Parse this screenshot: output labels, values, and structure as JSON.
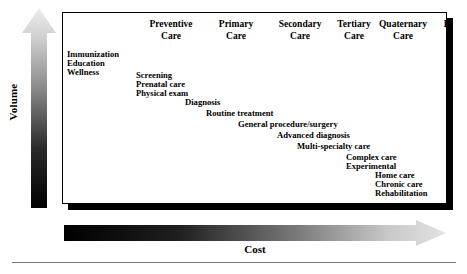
{
  "diagram": {
    "axes": {
      "vertical": {
        "label": "Volume",
        "icon": "up-arrow-icon",
        "direction": "up",
        "gradient_from": "#000000",
        "gradient_to": "#e8e8e8",
        "meaning": "volume increases downward toward preventive care"
      },
      "horizontal": {
        "label": "Cost",
        "icon": "right-arrow-icon",
        "direction": "right",
        "gradient_from": "#000000",
        "gradient_to": "#e0e0e0",
        "meaning": "cost increases toward extended care"
      }
    },
    "columns": [
      {
        "line1": "Preventive",
        "line2": "Care",
        "center_x": 108
      },
      {
        "line1": "Primary",
        "line2": "Care",
        "center_x": 173
      },
      {
        "line1": "Secondary",
        "line2": "Care",
        "center_x": 237
      },
      {
        "line1": "Tertiary",
        "line2": "Care",
        "center_x": 291
      },
      {
        "line1": "Quaternary",
        "line2": "Care",
        "center_x": 340
      },
      {
        "line1": "Extended",
        "line2": "Care",
        "center_x": 400
      }
    ],
    "services": [
      {
        "label": "Immunization",
        "x": 66,
        "y": 49,
        "column": "Preventive Care"
      },
      {
        "label": "Education",
        "x": 66,
        "y": 58,
        "column": "Preventive Care"
      },
      {
        "label": "Wellness",
        "x": 66,
        "y": 67,
        "column": "Preventive Care"
      },
      {
        "label": "Screening",
        "x": 135,
        "y": 70,
        "column": "Primary Care"
      },
      {
        "label": "Prenatal care",
        "x": 135,
        "y": 79,
        "column": "Primary Care"
      },
      {
        "label": "Physical exam",
        "x": 135,
        "y": 88,
        "column": "Primary Care"
      },
      {
        "label": "Diagnosis",
        "x": 184,
        "y": 97,
        "column": "Secondary Care"
      },
      {
        "label": "Routine treatment",
        "x": 205,
        "y": 108,
        "column": "Secondary Care"
      },
      {
        "label": "General procedure/surgery",
        "x": 237,
        "y": 119,
        "column": "Tertiary Care"
      },
      {
        "label": "Advanced diagnosis",
        "x": 276,
        "y": 130,
        "column": "Tertiary Care"
      },
      {
        "label": "Multi-specialty care",
        "x": 296,
        "y": 141,
        "column": "Quaternary Care"
      },
      {
        "label": "Complex care",
        "x": 345,
        "y": 152,
        "column": "Quaternary Care"
      },
      {
        "label": "Experimental",
        "x": 345,
        "y": 161,
        "column": "Quaternary Care"
      },
      {
        "label": "Home care",
        "x": 374,
        "y": 170,
        "column": "Extended Care"
      },
      {
        "label": "Chronic care",
        "x": 374,
        "y": 179,
        "column": "Extended Care"
      },
      {
        "label": "Rehabilitation",
        "x": 374,
        "y": 188,
        "column": "Extended Care"
      }
    ]
  }
}
